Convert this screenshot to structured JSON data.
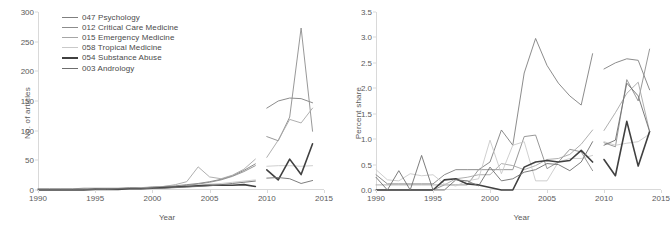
{
  "figure": {
    "background": "#ffffff",
    "panels": [
      "left",
      "right"
    ]
  },
  "legend": {
    "position": "top-left of left panel",
    "entries": [
      {
        "label": "047 Psychology",
        "color": "#7f7f7f",
        "width": 0.9
      },
      {
        "label": "012 Critical Care Medicine",
        "color": "#8c8c8c",
        "width": 0.9
      },
      {
        "label": "015 Emergency Medicine",
        "color": "#a6a6a6",
        "width": 0.9
      },
      {
        "label": "058 Tropical Medicine",
        "color": "#c9c9c9",
        "width": 0.9
      },
      {
        "label": "054 Substance Abuse",
        "color": "#404040",
        "width": 1.6
      },
      {
        "label": "003 Andrology",
        "color": "#6e6e6e",
        "width": 0.9
      }
    ]
  },
  "chart_data": [
    {
      "type": "line",
      "panel": "left",
      "title": "",
      "xlabel": "Year",
      "ylabel": "No. of articles",
      "xlim": [
        1990,
        2015
      ],
      "ylim": [
        0,
        300
      ],
      "xticks": [
        1990,
        1995,
        2000,
        2005,
        2010,
        2015
      ],
      "yticks": [
        0,
        50,
        100,
        150,
        200,
        250,
        300
      ],
      "grid": false,
      "note": "Each series is drawn as two disjoint segments: 1990-2009 and 2010-2014",
      "x_segment_a": [
        1990,
        1991,
        1992,
        1993,
        1994,
        1995,
        1996,
        1997,
        1998,
        1999,
        2000,
        2001,
        2002,
        2003,
        2004,
        2005,
        2006,
        2007,
        2008,
        2009
      ],
      "x_segment_b": [
        2010,
        2011,
        2012,
        2013,
        2014
      ],
      "series": [
        {
          "name": "047 Psychology",
          "color": "#7f7f7f",
          "values_a": [
            2,
            2,
            2,
            2,
            3,
            3,
            3,
            3,
            4,
            4,
            5,
            6,
            7,
            9,
            11,
            14,
            18,
            24,
            33,
            44
          ],
          "values_b": [
            138,
            150,
            155,
            154,
            147
          ]
        },
        {
          "name": "012 Critical Care Medicine",
          "color": "#8c8c8c",
          "values_a": [
            1,
            1,
            1,
            1,
            2,
            2,
            2,
            2,
            3,
            3,
            4,
            5,
            6,
            8,
            10,
            13,
            17,
            23,
            31,
            41
          ],
          "values_b": [
            90,
            83,
            123,
            273,
            99
          ]
        },
        {
          "name": "015 Emergency Medicine",
          "color": "#a6a6a6",
          "values_a": [
            1,
            1,
            1,
            1,
            1,
            2,
            2,
            2,
            3,
            3,
            5,
            6,
            9,
            14,
            39,
            22,
            19,
            25,
            35,
            52
          ],
          "values_b": [
            55,
            84,
            119,
            113,
            138
          ]
        },
        {
          "name": "058 Tropical Medicine",
          "color": "#c9c9c9",
          "values_a": [
            1,
            1,
            1,
            1,
            1,
            1,
            2,
            2,
            2,
            3,
            3,
            4,
            5,
            6,
            8,
            10,
            11,
            13,
            15,
            17
          ],
          "values_b": [
            40,
            41,
            41,
            40,
            41
          ]
        },
        {
          "name": "054 Substance Abuse",
          "color": "#404040",
          "values_a": [
            0,
            0,
            0,
            0,
            0,
            1,
            1,
            1,
            2,
            2,
            3,
            4,
            5,
            6,
            7,
            8,
            8,
            8,
            9,
            6
          ],
          "values_b": [
            34,
            17,
            52,
            26,
            78
          ]
        },
        {
          "name": "003 Andrology",
          "color": "#6e6e6e",
          "values_a": [
            1,
            1,
            1,
            1,
            1,
            1,
            1,
            2,
            2,
            2,
            3,
            3,
            4,
            5,
            6,
            7,
            9,
            11,
            13,
            15
          ],
          "values_b": [
            20,
            21,
            19,
            11,
            16
          ]
        }
      ]
    },
    {
      "type": "line",
      "panel": "right",
      "title": "",
      "xlabel": "Year",
      "ylabel": "Percent share",
      "xlim": [
        1990,
        2015
      ],
      "ylim": [
        0.0,
        3.5
      ],
      "xticks": [
        1990,
        1995,
        2000,
        2005,
        2010,
        2015
      ],
      "yticks": [
        "0.0",
        "0.5",
        "1.0",
        "1.5",
        "2.0",
        "2.5",
        "3.0",
        "3.5"
      ],
      "grid": false,
      "note": "Each series is drawn as two disjoint segments: 1990-2009 and 2010-2014",
      "x_segment_a": [
        1990,
        1991,
        1992,
        1993,
        1994,
        1995,
        1996,
        1997,
        1998,
        1999,
        2000,
        2001,
        2002,
        2003,
        2004,
        2005,
        2006,
        2007,
        2008,
        2009
      ],
      "x_segment_b": [
        2010,
        2011,
        2012,
        2013,
        2014
      ],
      "series": [
        {
          "name": "047 Psychology",
          "color": "#7f7f7f",
          "values_a": [
            0.3,
            0.12,
            0.12,
            0.12,
            0.12,
            0.12,
            0.3,
            0.4,
            0.4,
            0.4,
            0.55,
            1.18,
            0.88,
            2.3,
            2.98,
            2.45,
            2.1,
            1.85,
            1.67,
            2.68
          ],
          "values_b": [
            2.38,
            2.5,
            2.58,
            2.55,
            1.97
          ]
        },
        {
          "name": "012 Critical Care Medicine",
          "color": "#8c8c8c",
          "values_a": [
            0.0,
            0.0,
            0.0,
            0.0,
            0.0,
            0.0,
            0.1,
            0.1,
            0.1,
            0.4,
            0.4,
            0.4,
            0.4,
            1.05,
            1.08,
            0.42,
            0.55,
            0.8,
            0.75,
            0.38
          ],
          "values_b": [
            0.93,
            0.85,
            2.17,
            1.75,
            2.77
          ]
        },
        {
          "name": "015 Emergency Medicine",
          "color": "#a6a6a6",
          "values_a": [
            0.1,
            0.1,
            0.1,
            0.1,
            0.1,
            0.1,
            0.1,
            0.22,
            0.25,
            0.3,
            0.3,
            0.52,
            0.48,
            0.4,
            0.48,
            0.6,
            0.62,
            0.7,
            0.9,
            1.18
          ],
          "values_b": [
            1.17,
            1.52,
            1.9,
            2.12,
            1.15
          ]
        },
        {
          "name": "058 Tropical Medicine",
          "color": "#c9c9c9",
          "values_a": [
            0.4,
            0.2,
            0.18,
            0.32,
            0.28,
            0.3,
            0.12,
            0.08,
            0.18,
            0.22,
            0.98,
            0.32,
            0.88,
            0.95,
            0.18,
            0.18,
            0.55,
            0.62,
            0.62,
            0.68
          ],
          "values_b": [
            0.95,
            0.88,
            0.92,
            0.95,
            1.1
          ]
        },
        {
          "name": "054 Substance Abuse",
          "color": "#404040",
          "values_a": [
            0.0,
            0.0,
            0.0,
            0.0,
            0.0,
            0.0,
            0.2,
            0.22,
            0.12,
            0.1,
            0.05,
            0.0,
            0.0,
            0.45,
            0.55,
            0.58,
            0.55,
            0.58,
            0.78,
            0.55
          ],
          "values_b": [
            0.6,
            0.28,
            1.35,
            0.47,
            1.15
          ]
        },
        {
          "name": "003 Andrology",
          "color": "#6e6e6e",
          "values_a": [
            0.25,
            0.0,
            0.38,
            0.0,
            0.68,
            0.0,
            0.0,
            0.2,
            0.18,
            0.08,
            0.45,
            0.18,
            0.22,
            0.35,
            0.4,
            0.52,
            0.5,
            0.38,
            0.55,
            0.95
          ],
          "values_b": [
            0.88,
            0.98,
            2.1,
            1.85,
            1.15
          ]
        }
      ]
    }
  ]
}
